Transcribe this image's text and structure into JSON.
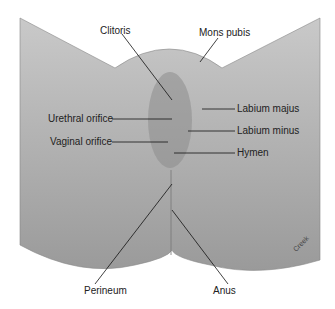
{
  "diagram": {
    "type": "anatomical-illustration",
    "signature": "Creek",
    "labels": {
      "clitoris": "Clitoris",
      "mons_pubis": "Mons pubis",
      "labium_majus": "Labium majus",
      "urethral_orifice": "Urethral orifice",
      "labium_minus": "Labium minus",
      "vaginal_orifice": "Vaginal orifice",
      "hymen": "Hymen",
      "perineum": "Perineum",
      "anus": "Anus"
    }
  }
}
